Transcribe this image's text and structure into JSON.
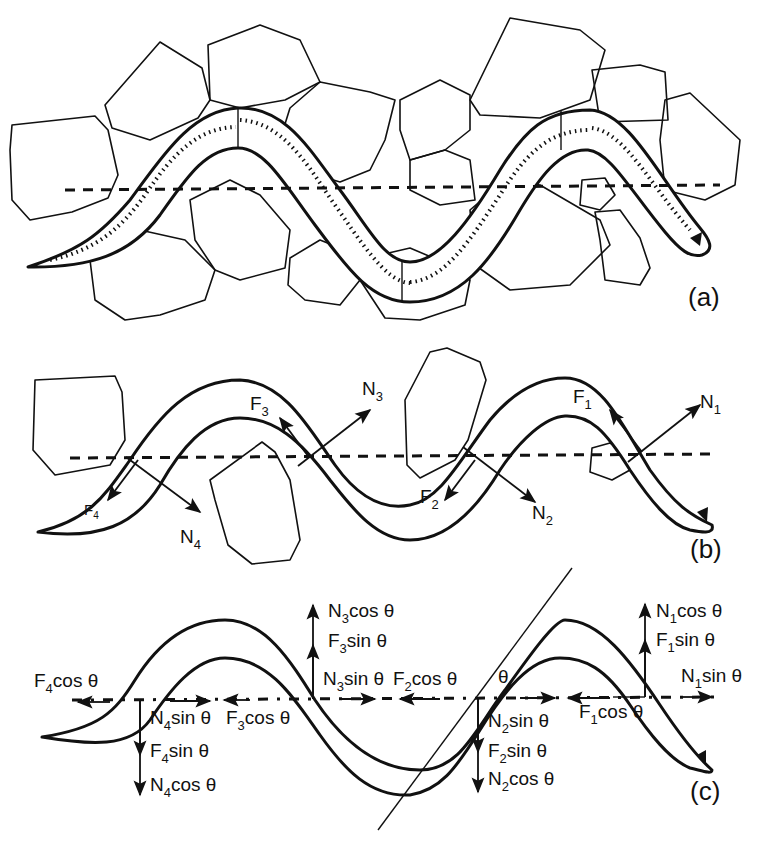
{
  "figure": {
    "panels": [
      {
        "id": "a",
        "label": "(a)",
        "content": "Snake body winding between irregular rocks; stippled body segments alternate; dashed horizontal line marks direction of travel"
      },
      {
        "id": "b",
        "label": "(b)",
        "content": "Snake pushing against four rocks; at each contact point, normal force N and frictional force F shown",
        "forces": [
          {
            "name": "F",
            "sub": "1"
          },
          {
            "name": "N",
            "sub": "1"
          },
          {
            "name": "F",
            "sub": "2"
          },
          {
            "name": "N",
            "sub": "2"
          },
          {
            "name": "F",
            "sub": "3"
          },
          {
            "name": "N",
            "sub": "3"
          },
          {
            "name": "F",
            "sub": "4"
          },
          {
            "name": "N",
            "sub": "4"
          }
        ]
      },
      {
        "id": "c",
        "label": "(c)",
        "content": "Decomposition of forces into components parallel and perpendicular to the direction of travel using angle θ",
        "angle_symbol": "θ",
        "components": {
          "contact1_up": [
            {
              "n": "N",
              "s": "1",
              "t": "cos θ"
            },
            {
              "n": "F",
              "s": "1",
              "t": "sin θ"
            }
          ],
          "contact1_right": {
            "n": "N",
            "s": "1",
            "t": "sin θ"
          },
          "contact1_left": {
            "n": "F",
            "s": "1",
            "t": "cos θ"
          },
          "contact2_down": [
            {
              "n": "N",
              "s": "2",
              "t": "sin θ"
            },
            {
              "n": "F",
              "s": "2",
              "t": "sin θ"
            },
            {
              "n": "N",
              "s": "2",
              "t": "cos θ"
            }
          ],
          "contact2_left": {
            "n": "F",
            "s": "2",
            "t": "cos θ"
          },
          "contact3_up": [
            {
              "n": "N",
              "s": "3",
              "t": "cos θ"
            },
            {
              "n": "F",
              "s": "3",
              "t": "sin θ"
            }
          ],
          "contact3_right": {
            "n": "N",
            "s": "3",
            "t": "sin θ"
          },
          "contact3_left": {
            "n": "F",
            "s": "3",
            "t": "cos θ"
          },
          "contact4_down": [
            {
              "n": "N",
              "s": "4",
              "t": "sin θ"
            },
            {
              "n": "F",
              "s": "4",
              "t": "sin θ"
            },
            {
              "n": "N",
              "s": "4",
              "t": "cos θ"
            }
          ],
          "contact4_left": {
            "n": "F",
            "s": "4",
            "t": "cos θ"
          }
        }
      }
    ]
  }
}
